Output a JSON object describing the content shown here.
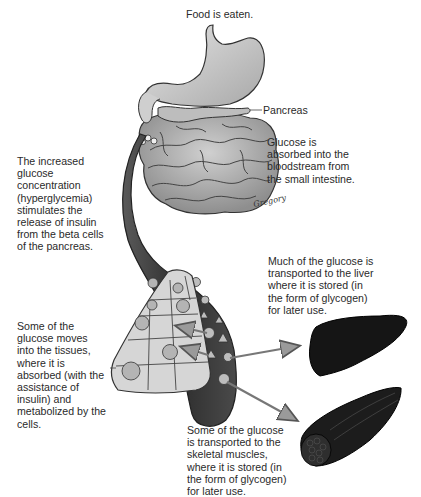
{
  "diagram": {
    "labels": {
      "food_eaten": "Food is eaten.",
      "pancreas": "Pancreas",
      "glucose_absorbed": "Glucose is\nabsorbed into the\nbloodstream from\nthe small intestine.",
      "hyperglycemia": "The increased\nglucose\nconcentration\n(hyperglycemia)\nstimulates the\nrelease of insulin\nfrom the beta cells\nof the pancreas.",
      "liver": "Much of the glucose is\ntransported to the liver\nwhere it is stored (in\nthe form of glycogen)\nfor later use.",
      "tissues": "Some of the\nglucose moves\ninto the tissues,\nwhere it is\nabsorbed (with the\nassistance of\ninsulin) and\nmetabolized by the\ncells.",
      "muscles": "Some of the glucose\nis transported to the\nskeletal muscles,\nwhere it is stored (in\nthe form of glycogen)\nfor later use.",
      "signature": "Gregory"
    },
    "structures": [
      "stomach",
      "pancreas",
      "small-intestine",
      "blood-vessel",
      "tissue-cells",
      "liver",
      "skeletal-muscle"
    ],
    "colors": {
      "organ_fill": "#c8c8c8",
      "organ_stroke": "#3a3a3a",
      "vessel_dark": "#3c3c3c",
      "liver": "#1a1a1a",
      "cells": "#d4d4d4",
      "arrow": "#6e6e6e"
    }
  }
}
